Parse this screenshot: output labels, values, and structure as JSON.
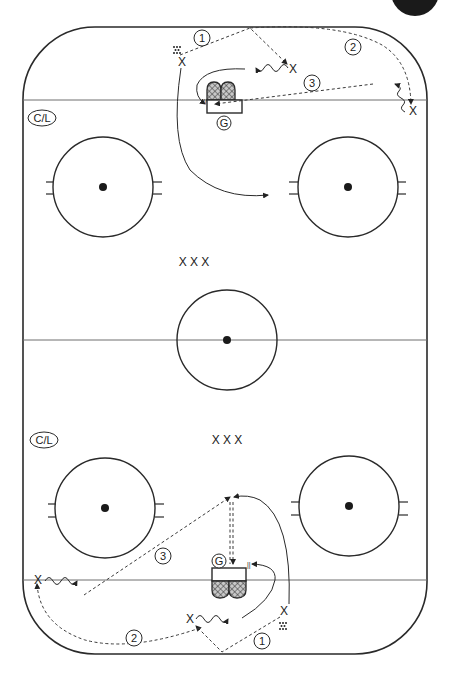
{
  "diagram": {
    "type": "hockey-drill",
    "page_marker_color": "#1a1a1a",
    "top_half": {
      "coach_label": "C/L",
      "goalie_label": "G",
      "group_label": "X X X",
      "steps": [
        {
          "number": "1",
          "label": "1"
        },
        {
          "number": "2",
          "label": "2"
        },
        {
          "number": "3",
          "label": "3"
        }
      ],
      "player_marks": [
        "X",
        "X",
        "X"
      ]
    },
    "bottom_half": {
      "coach_label": "C/L",
      "goalie_label": "G",
      "group_label": "X X X",
      "steps": [
        {
          "number": "1",
          "label": "1"
        },
        {
          "number": "2",
          "label": "2"
        },
        {
          "number": "3",
          "label": "3"
        }
      ],
      "player_marks": [
        "X",
        "X",
        "X"
      ]
    },
    "legend": {
      "dashed_line": "pass",
      "wavy_line": "skate with puck",
      "solid_line": "skate without puck",
      "double_dash": "shot",
      "dots": "pucks"
    }
  }
}
